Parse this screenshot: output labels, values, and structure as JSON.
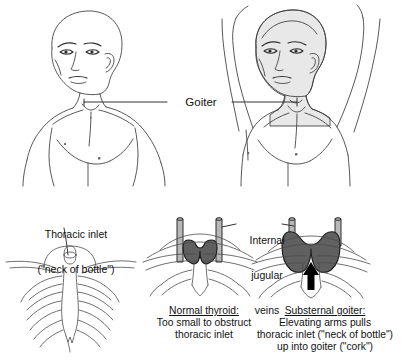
{
  "figure": {
    "background_color": "#ffffff",
    "line_color": "#3a3a3a",
    "text_color": "#111111",
    "skin_shade_color": "#e8e8e8",
    "thyroid_fill_color": "#606060",
    "vein_fill_color": "#b8b8b8",
    "arrow_color": "#000000"
  },
  "top_panel": {
    "goiter_label": "Goiter",
    "left_figure": {
      "name": "patient-arms-down",
      "shaded": false
    },
    "right_figure": {
      "name": "patient-arms-raised",
      "shaded": true
    }
  },
  "bottom_panel": {
    "thoracic_inlet_label": {
      "line1": "Thoracic inlet",
      "line2": "(\"neck of bottle\")"
    },
    "jugular_label": {
      "line1": "Internal",
      "line2": "jugular",
      "line3": "veins"
    },
    "normal_thyroid_caption": {
      "heading": "Normal thyroid:",
      "line1": "Too small to obstruct",
      "line2": "thoracic inlet"
    },
    "substernal_goiter_caption": {
      "heading": "Substernal goiter:",
      "line1": "Elevating arms pulls",
      "line2": "thoracic inlet (\"neck of bottle\")",
      "line3": "up into goiter (\"cork\")"
    }
  }
}
